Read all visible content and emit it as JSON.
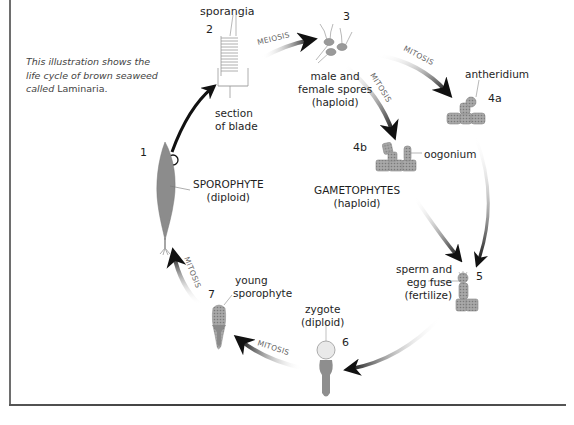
{
  "caption": {
    "text": "This illustration shows the life cycle of brown seaweed called",
    "line1": "This illustration shows the",
    "line2": "life cycle of brown seaweed",
    "line3_prefix": "called",
    "genus": "Laminaria."
  },
  "stages": [
    {
      "number": "1",
      "label_line1": "SPOROPHYTE",
      "label_line2": "(diploid)"
    },
    {
      "number": "2",
      "label_top": "sporangia",
      "label_line1": "section",
      "label_line2": "of blade"
    },
    {
      "number": "3",
      "label_line1": "male and",
      "label_line2": "female spores",
      "label_line3": "(haploid)"
    },
    {
      "number": "4a",
      "label": "antheridium"
    },
    {
      "number": "4b",
      "label": "oogonium"
    },
    {
      "number": "5",
      "label_line1": "sperm and",
      "label_line2": "egg fuse",
      "label_line3": "(fertilize)"
    },
    {
      "number": "6",
      "label_line1": "zygote",
      "label_line2": "(diploid)"
    },
    {
      "number": "7",
      "label_line1": "young",
      "label_line2": "sporophyte"
    }
  ],
  "gametophytes": {
    "line1": "GAMETOPHYTES",
    "line2": "(haploid)"
  },
  "processes": {
    "meiosis": "MEIOSIS",
    "mitosis_3_4a": "MITOSIS",
    "mitosis_3_4b": "MITOSIS",
    "mitosis_6_7": "MITOSIS",
    "mitosis_7_1": "MITOSIS"
  },
  "colors": {
    "arrow": "#1a1a1a",
    "organism_gray": "#8a8a8a",
    "frame": "#555555"
  }
}
